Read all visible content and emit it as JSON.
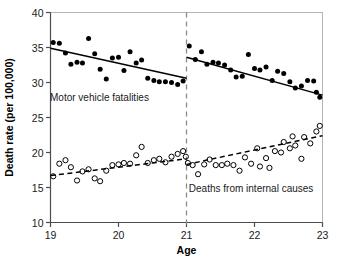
{
  "chart_data": {
    "type": "scatter",
    "title": "",
    "xlabel": "Age",
    "ylabel": "Death rate (per 100,000)",
    "xlim": [
      19,
      23
    ],
    "ylim": [
      10,
      40
    ],
    "xticks": [
      19,
      20,
      21,
      22,
      23
    ],
    "xticklabels": [
      "19",
      "20",
      "21",
      "22",
      "23"
    ],
    "yticks": [
      10,
      15,
      20,
      25,
      30,
      35,
      40
    ],
    "yticklabels": [
      "10",
      "15",
      "20",
      "25",
      "30",
      "35",
      "40"
    ],
    "grid": false,
    "legend": "none",
    "annotations": [
      {
        "name": "motor-vehicle-label",
        "text": "Motor vehicle fatalities",
        "x": 19.72,
        "y": 27.4
      },
      {
        "name": "internal-causes-label",
        "text": "Deaths from internal causes",
        "x": 21.95,
        "y": 14.3
      }
    ],
    "vlines": [
      {
        "name": "age-21-threshold",
        "x": 21,
        "style": "dashed",
        "color": "#8c8c8c"
      }
    ],
    "series": [
      {
        "name": "Motor vehicle fatalities",
        "marker": "filled-circle",
        "color": "#000000",
        "points": [
          {
            "x": 19.04,
            "y": 35.7
          },
          {
            "x": 19.13,
            "y": 35.6
          },
          {
            "x": 19.22,
            "y": 34.2
          },
          {
            "x": 19.3,
            "y": 32.6
          },
          {
            "x": 19.39,
            "y": 32.9
          },
          {
            "x": 19.47,
            "y": 32.8
          },
          {
            "x": 19.56,
            "y": 36.3
          },
          {
            "x": 19.65,
            "y": 34.1
          },
          {
            "x": 19.73,
            "y": 31.9
          },
          {
            "x": 19.82,
            "y": 30.5
          },
          {
            "x": 19.91,
            "y": 33.5
          },
          {
            "x": 20.0,
            "y": 33.6
          },
          {
            "x": 20.08,
            "y": 31.7
          },
          {
            "x": 20.17,
            "y": 34.4
          },
          {
            "x": 20.26,
            "y": 32.8
          },
          {
            "x": 20.34,
            "y": 33.2
          },
          {
            "x": 20.43,
            "y": 30.6
          },
          {
            "x": 20.52,
            "y": 30.3
          },
          {
            "x": 20.6,
            "y": 30.1
          },
          {
            "x": 20.69,
            "y": 30.1
          },
          {
            "x": 20.78,
            "y": 30.0
          },
          {
            "x": 20.87,
            "y": 29.7
          },
          {
            "x": 20.95,
            "y": 30.2
          },
          {
            "x": 21.04,
            "y": 35.2
          },
          {
            "x": 21.13,
            "y": 33.3
          },
          {
            "x": 21.22,
            "y": 34.4
          },
          {
            "x": 21.3,
            "y": 32.6
          },
          {
            "x": 21.39,
            "y": 32.9
          },
          {
            "x": 21.47,
            "y": 32.8
          },
          {
            "x": 21.56,
            "y": 32.5
          },
          {
            "x": 21.65,
            "y": 31.8
          },
          {
            "x": 21.73,
            "y": 30.8
          },
          {
            "x": 21.82,
            "y": 30.9
          },
          {
            "x": 21.91,
            "y": 34.0
          },
          {
            "x": 22.0,
            "y": 32.0
          },
          {
            "x": 22.08,
            "y": 31.8
          },
          {
            "x": 22.17,
            "y": 32.2
          },
          {
            "x": 22.26,
            "y": 30.3
          },
          {
            "x": 22.34,
            "y": 31.6
          },
          {
            "x": 22.43,
            "y": 31.3
          },
          {
            "x": 22.52,
            "y": 30.1
          },
          {
            "x": 22.6,
            "y": 29.2
          },
          {
            "x": 22.69,
            "y": 29.5
          },
          {
            "x": 22.78,
            "y": 30.3
          },
          {
            "x": 22.87,
            "y": 30.2
          },
          {
            "x": 22.91,
            "y": 28.6
          },
          {
            "x": 22.96,
            "y": 27.9
          }
        ],
        "fit_segments": [
          {
            "name": "before-21",
            "x0": 19.0,
            "y0": 34.9,
            "x1": 21.0,
            "y1": 30.6,
            "style": "solid"
          },
          {
            "name": "after-21",
            "x0": 21.0,
            "y0": 33.6,
            "x1": 23.0,
            "y1": 28.2,
            "style": "solid"
          }
        ]
      },
      {
        "name": "Deaths from internal causes",
        "marker": "open-circle",
        "color": "#000000",
        "points": [
          {
            "x": 19.04,
            "y": 16.6
          },
          {
            "x": 19.13,
            "y": 18.4
          },
          {
            "x": 19.22,
            "y": 18.9
          },
          {
            "x": 19.3,
            "y": 17.9
          },
          {
            "x": 19.39,
            "y": 16.0
          },
          {
            "x": 19.47,
            "y": 17.3
          },
          {
            "x": 19.56,
            "y": 17.6
          },
          {
            "x": 19.65,
            "y": 16.3
          },
          {
            "x": 19.73,
            "y": 15.9
          },
          {
            "x": 19.82,
            "y": 17.4
          },
          {
            "x": 19.91,
            "y": 18.2
          },
          {
            "x": 20.0,
            "y": 18.3
          },
          {
            "x": 20.08,
            "y": 18.5
          },
          {
            "x": 20.17,
            "y": 18.4
          },
          {
            "x": 20.26,
            "y": 19.6
          },
          {
            "x": 20.34,
            "y": 20.8
          },
          {
            "x": 20.43,
            "y": 18.5
          },
          {
            "x": 20.52,
            "y": 18.9
          },
          {
            "x": 20.6,
            "y": 19.1
          },
          {
            "x": 20.69,
            "y": 18.6
          },
          {
            "x": 20.78,
            "y": 19.4
          },
          {
            "x": 20.87,
            "y": 19.8
          },
          {
            "x": 20.95,
            "y": 20.2
          },
          {
            "x": 20.99,
            "y": 19.4
          },
          {
            "x": 21.02,
            "y": 18.5
          },
          {
            "x": 21.09,
            "y": 18.2
          },
          {
            "x": 21.17,
            "y": 16.9
          },
          {
            "x": 21.26,
            "y": 18.3
          },
          {
            "x": 21.34,
            "y": 19.0
          },
          {
            "x": 21.43,
            "y": 18.2
          },
          {
            "x": 21.52,
            "y": 18.2
          },
          {
            "x": 21.6,
            "y": 18.4
          },
          {
            "x": 21.69,
            "y": 18.2
          },
          {
            "x": 21.78,
            "y": 17.4
          },
          {
            "x": 21.86,
            "y": 19.3
          },
          {
            "x": 21.95,
            "y": 18.4
          },
          {
            "x": 22.04,
            "y": 20.6
          },
          {
            "x": 22.08,
            "y": 18.0
          },
          {
            "x": 22.17,
            "y": 19.2
          },
          {
            "x": 22.22,
            "y": 17.8
          },
          {
            "x": 22.3,
            "y": 20.2
          },
          {
            "x": 22.39,
            "y": 20.0
          },
          {
            "x": 22.43,
            "y": 21.5
          },
          {
            "x": 22.52,
            "y": 20.6
          },
          {
            "x": 22.56,
            "y": 22.3
          },
          {
            "x": 22.6,
            "y": 21.0
          },
          {
            "x": 22.69,
            "y": 19.1
          },
          {
            "x": 22.73,
            "y": 22.2
          },
          {
            "x": 22.82,
            "y": 21.3
          },
          {
            "x": 22.91,
            "y": 23.0
          },
          {
            "x": 22.96,
            "y": 23.8
          }
        ],
        "fit_segments": [
          {
            "name": "before-21",
            "x0": 19.0,
            "y0": 16.7,
            "x1": 21.0,
            "y1": 19.1,
            "style": "dashed"
          },
          {
            "name": "after-21",
            "x0": 21.0,
            "y0": 18.3,
            "x1": 23.0,
            "y1": 22.4,
            "style": "dashed"
          }
        ]
      }
    ]
  }
}
